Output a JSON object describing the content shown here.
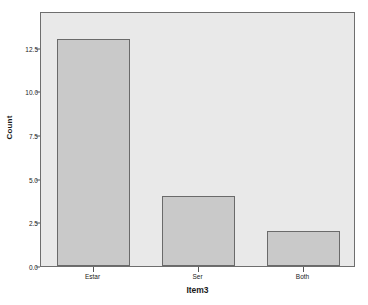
{
  "chart_data": {
    "type": "bar",
    "title": "",
    "subtitle": "",
    "xlabel": "Item3",
    "ylabel": "Count",
    "categories": [
      "Estar",
      "Ser",
      "Both"
    ],
    "values": [
      13,
      4,
      2
    ],
    "series": [
      {
        "name": "Count",
        "values": [
          13,
          4,
          2
        ]
      }
    ],
    "ylim": [
      0,
      14.6
    ],
    "yticks": [
      0,
      2.5,
      5,
      7.5,
      10,
      12.5
    ],
    "ytick_labels": [
      "0.0",
      "2.5",
      "5.0",
      "7.5",
      "10.0",
      "12.5"
    ],
    "grid": false,
    "legend": null,
    "legend_position": "none",
    "annotations": [],
    "colors": {
      "bar_fill": "#c9c9c9",
      "bar_border": "#6a6a6a",
      "plot_background": "#e9e9e9",
      "figure_background": "#ffffff",
      "axis_line": "#6e6e6e",
      "text": "#1a1a1a"
    }
  }
}
